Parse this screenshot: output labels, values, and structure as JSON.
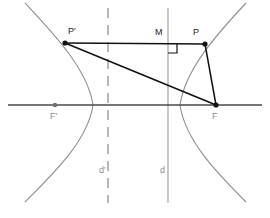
{
  "figure": {
    "width": 270,
    "height": 218,
    "background": "#ffffff"
  },
  "colors": {
    "curve": "#8f8f8f",
    "axis": "#4a4a4a",
    "directrix": "#9a9a9a",
    "directrix_dashed": "#9a9a9a",
    "construction": "#111111",
    "label_dark": "#1a1a1a",
    "label_gray": "#8d8d8d"
  },
  "labels": {
    "p_prime": "P'",
    "p": "P",
    "m": "M",
    "f_prime": "F'",
    "f": "F",
    "d_prime": "d'",
    "d": "d"
  },
  "label_positions": {
    "p_prime": {
      "x": 68,
      "y": 27
    },
    "p": {
      "x": 193,
      "y": 28
    },
    "m": {
      "x": 155,
      "y": 28
    },
    "f_prime": {
      "x": 50,
      "y": 112
    },
    "f": {
      "x": 212,
      "y": 112
    },
    "d_prime": {
      "x": 99,
      "y": 166
    },
    "d": {
      "x": 160,
      "y": 166
    }
  },
  "points": {
    "p_prime": {
      "x": 65,
      "y": 43,
      "marker": "dot"
    },
    "p": {
      "x": 205,
      "y": 44,
      "marker": "dot"
    },
    "f": {
      "x": 216,
      "y": 105,
      "marker": "dot"
    },
    "f_prime": {
      "x": 55,
      "y": 105,
      "marker": "dot"
    },
    "m": {
      "x": 168,
      "y": 43.5,
      "marker": "none"
    }
  },
  "lines": {
    "horizontal_axis": {
      "x1": 8,
      "y1": 105,
      "x2": 262,
      "y2": 105
    },
    "segment_pp_prime": {
      "x1": 65,
      "y1": 43,
      "x2": 205,
      "y2": 44
    },
    "segment_p_prime_f": {
      "x1": 65,
      "y1": 43,
      "x2": 216,
      "y2": 105
    },
    "segment_pf": {
      "x1": 205,
      "y1": 44,
      "x2": 216,
      "y2": 105
    },
    "directrix_d": {
      "x1": 168,
      "y1": 8,
      "x2": 168,
      "y2": 203
    },
    "directrix_d_prime": {
      "x1": 108,
      "y1": 8,
      "x2": 108,
      "y2": 203
    }
  },
  "right_angle_marker": {
    "corner_x": 168,
    "corner_y": 44,
    "size": 9,
    "at": "M"
  },
  "curves": {
    "left_branch": {
      "vertex": {
        "x": 93,
        "y": 105
      },
      "top_end": {
        "x": 25,
        "y": 3
      },
      "bottom_end": {
        "x": 25,
        "y": 202
      }
    },
    "right_branch": {
      "vertex": {
        "x": 180,
        "y": 105
      },
      "top_end": {
        "x": 246,
        "y": 3
      },
      "bottom_end": {
        "x": 246,
        "y": 202
      }
    }
  }
}
